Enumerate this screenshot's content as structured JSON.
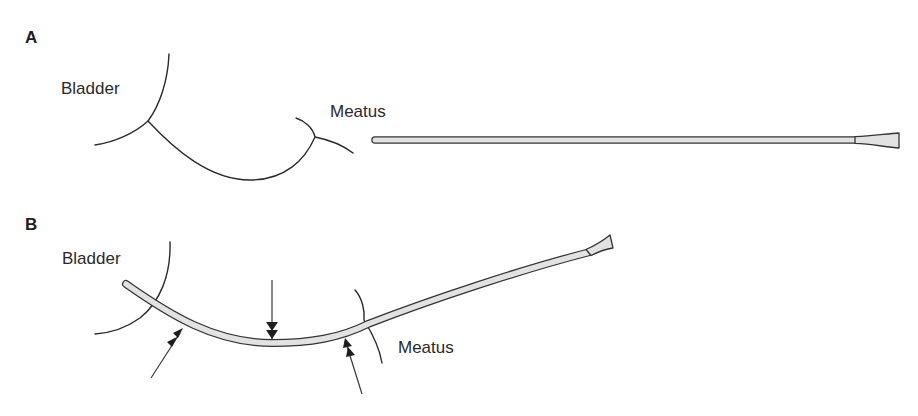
{
  "figure": {
    "panels": [
      {
        "letter": "A",
        "labels": {
          "bladder": "Bladder",
          "meatus": "Meatus"
        },
        "description": "Straight catheter beside urethral anatomy"
      },
      {
        "letter": "B",
        "labels": {
          "bladder": "Bladder",
          "meatus": "Meatus"
        },
        "description": "Curved catheter inserted through urethra with pressure-point arrows"
      }
    ],
    "colors": {
      "line": "#2b2b2b",
      "catheter_fill": "#e2e2e2",
      "background": "#ffffff"
    },
    "arrows": [
      {
        "name": "arrow-bladder-neck",
        "direction": "up-right"
      },
      {
        "name": "arrow-mid-urethra",
        "direction": "down"
      },
      {
        "name": "arrow-meatus",
        "direction": "up-left"
      }
    ]
  }
}
